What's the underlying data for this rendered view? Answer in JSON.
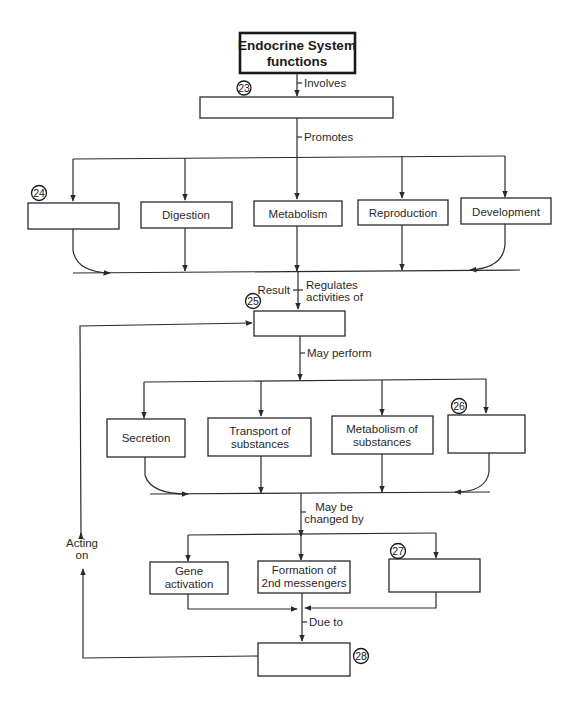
{
  "diagram": {
    "title_lines": [
      "Endocrine System",
      "functions"
    ],
    "level1": {
      "number": "23",
      "label": "",
      "edge_in": "Involves",
      "edge_out": "Promotes"
    },
    "promotes": [
      {
        "number": "24",
        "label": ""
      },
      {
        "label": "Digestion"
      },
      {
        "label": "Metabolism"
      },
      {
        "label": "Reproduction"
      },
      {
        "label": "Development"
      }
    ],
    "level2": {
      "number": "25",
      "label": "",
      "edge_left": "Result",
      "edge_right_lines": [
        "Regulates",
        "activities of"
      ],
      "edge_out": "May perform"
    },
    "performs": [
      {
        "lines": [
          "Secretion"
        ]
      },
      {
        "lines": [
          "Transport of",
          "substances"
        ]
      },
      {
        "lines": [
          "Metabolism of",
          "substances"
        ]
      },
      {
        "number": "26",
        "lines": []
      }
    ],
    "changed_by_label_lines": [
      "May be",
      "changed by"
    ],
    "changes": [
      {
        "lines": [
          "Gene",
          "activation"
        ]
      },
      {
        "lines": [
          "Formation of",
          "2nd messengers"
        ]
      },
      {
        "number": "27",
        "lines": []
      }
    ],
    "due_to_label": "Due to",
    "level3": {
      "number": "28",
      "label": ""
    },
    "feedback_label_lines": [
      "Acting",
      "on"
    ]
  }
}
